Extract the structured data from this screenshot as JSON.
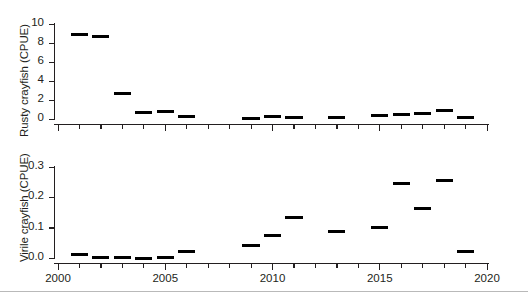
{
  "figure": {
    "background": "#ffffff",
    "line_color": "#231f20",
    "data_color": "#000000",
    "footer_rule_color": "#b9b9b9"
  },
  "chart_data": [
    {
      "type": "bar",
      "panel": "top",
      "title": "",
      "xlabel": "",
      "ylabel": "Rusty crayfish (CPUE)",
      "ylim": [
        0,
        10
      ],
      "xlim": [
        2000,
        2020
      ],
      "yticks": [
        "0",
        "2",
        "4",
        "6",
        "8",
        "10"
      ],
      "ytick_values": [
        0,
        2,
        4,
        6,
        8,
        10
      ],
      "xticks": [
        "2000",
        "2005",
        "2010",
        "2015",
        "2020"
      ],
      "xtick_values": [
        2000,
        2005,
        2010,
        2015,
        2020
      ],
      "xminor_values": [
        2001,
        2002,
        2003,
        2004,
        2006,
        2007,
        2008,
        2009,
        2011,
        2012,
        2013,
        2014,
        2016,
        2017,
        2018,
        2019
      ],
      "grid": false,
      "legend": "none",
      "x": [
        2001,
        2002,
        2003,
        2004,
        2005,
        2006,
        2009,
        2010,
        2011,
        2013,
        2015,
        2016,
        2017,
        2018,
        2019
      ],
      "values": [
        8.9,
        8.7,
        2.65,
        0.7,
        0.75,
        0.3,
        0.05,
        0.25,
        0.2,
        0.15,
        0.35,
        0.45,
        0.55,
        0.9,
        0.2
      ]
    },
    {
      "type": "bar",
      "panel": "bottom",
      "title": "",
      "xlabel": "",
      "ylabel": "Virile crayfish (CPUE)",
      "ylim": [
        0.0,
        0.3
      ],
      "xlim": [
        2000,
        2020
      ],
      "yticks": [
        "0.0",
        "0.1",
        "0.2",
        "0.3"
      ],
      "ytick_values": [
        0.0,
        0.1,
        0.2,
        0.3
      ],
      "xticks": [
        "2000",
        "2005",
        "2010",
        "2015",
        "2020"
      ],
      "xtick_values": [
        2000,
        2005,
        2010,
        2015,
        2020
      ],
      "xminor_values": [
        2001,
        2002,
        2003,
        2004,
        2006,
        2007,
        2008,
        2009,
        2011,
        2012,
        2013,
        2014,
        2016,
        2017,
        2018,
        2019
      ],
      "grid": false,
      "legend": "none",
      "x": [
        2001,
        2002,
        2003,
        2004,
        2005,
        2006,
        2009,
        2010,
        2011,
        2013,
        2015,
        2016,
        2017,
        2018,
        2019
      ],
      "values": [
        0.012,
        0.002,
        0.003,
        -0.002,
        0.002,
        0.022,
        0.04,
        0.075,
        0.135,
        0.087,
        0.1,
        0.247,
        0.162,
        0.255,
        0.022
      ]
    }
  ]
}
